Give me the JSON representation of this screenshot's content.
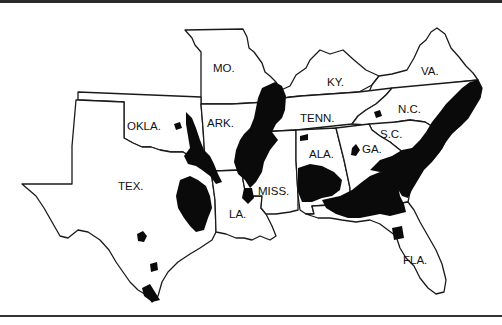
{
  "map": {
    "title": "",
    "region": "Southern United States",
    "shade_color": "#0a0a0a",
    "border_color": "#1a1a1a",
    "states": [
      {
        "id": "mo",
        "label": "MO."
      },
      {
        "id": "ky",
        "label": "KY."
      },
      {
        "id": "va",
        "label": "VA."
      },
      {
        "id": "okla",
        "label": "OKLA."
      },
      {
        "id": "ark",
        "label": "ARK."
      },
      {
        "id": "tenn",
        "label": "TENN."
      },
      {
        "id": "nc",
        "label": "N.C."
      },
      {
        "id": "sc",
        "label": "S.C."
      },
      {
        "id": "tex",
        "label": "TEX."
      },
      {
        "id": "ala",
        "label": "ALA."
      },
      {
        "id": "ga",
        "label": "GA."
      },
      {
        "id": "miss",
        "label": "MISS."
      },
      {
        "id": "la",
        "label": "LA."
      },
      {
        "id": "fla",
        "label": "FLA."
      }
    ]
  }
}
